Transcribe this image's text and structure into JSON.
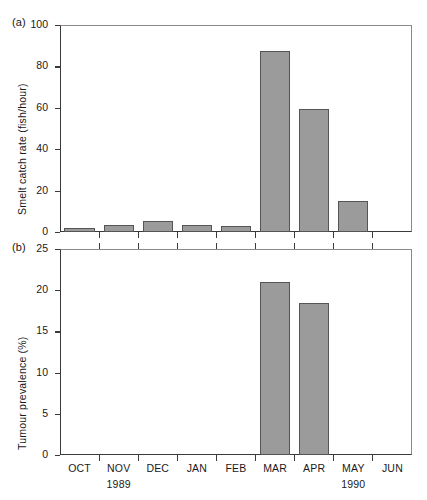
{
  "figure": {
    "panels": [
      {
        "letter": "(a)",
        "ylabel": "Smelt catch rate (fish/hour)",
        "yticks": [
          "0",
          "20",
          "40",
          "60",
          "80",
          "100"
        ]
      },
      {
        "letter": "(b)",
        "ylabel": "Tumour prevalence (%)",
        "yticks": [
          "0",
          "5",
          "10",
          "15",
          "20",
          "25"
        ]
      }
    ],
    "xaxis": {
      "months": [
        "OCT",
        "NOV",
        "DEC",
        "JAN",
        "FEB",
        "MAR",
        "APR",
        "MAY",
        "JUN"
      ],
      "year_labels": [
        {
          "text": "1989",
          "month_index": 1
        },
        {
          "text": "1990",
          "month_index": 7
        }
      ]
    },
    "colors": {
      "bar_fill": "#9b9b9b",
      "bar_edge": "#555555",
      "axis": "#3a3a3a",
      "background": "#ffffff"
    }
  },
  "chart_data": [
    {
      "type": "bar",
      "panel": "(a)",
      "title": "",
      "xlabel": "",
      "ylabel": "Smelt catch rate (fish/hour)",
      "categories": [
        "OCT",
        "NOV",
        "DEC",
        "JAN",
        "FEB",
        "MAR",
        "APR",
        "MAY",
        "JUN"
      ],
      "values": [
        2.0,
        3.5,
        5.5,
        3.2,
        3.0,
        87.5,
        59.5,
        15.0,
        0
      ],
      "ylim": [
        0,
        100
      ],
      "ytick_values": [
        0,
        20,
        40,
        60,
        80,
        100
      ],
      "grid": false,
      "legend": "none"
    },
    {
      "type": "bar",
      "panel": "(b)",
      "title": "",
      "xlabel": "",
      "ylabel": "Tumour prevalence (%)",
      "categories": [
        "OCT",
        "NOV",
        "DEC",
        "JAN",
        "FEB",
        "MAR",
        "APR",
        "MAY",
        "JUN"
      ],
      "values": [
        0,
        0,
        0,
        0,
        0,
        21.0,
        18.4,
        0,
        0
      ],
      "ylim": [
        0,
        25
      ],
      "ytick_values": [
        0,
        5,
        10,
        15,
        20,
        25
      ],
      "grid": false,
      "legend": "none"
    }
  ]
}
